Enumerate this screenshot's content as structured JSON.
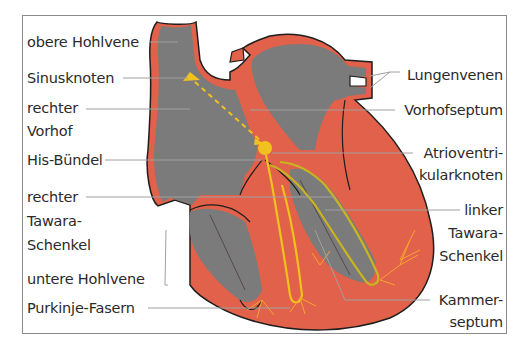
{
  "diagram": {
    "colors": {
      "chamber": "#7b7b7b",
      "muscle": "#e2614a",
      "outline": "#1e1e1e",
      "conduction": "#efc21e",
      "purkinje": "#f6a531",
      "leader": "#a0a0a0",
      "frame": "#8a8a8a"
    },
    "labels_left": [
      {
        "id": "obere-hohlvene",
        "lines": [
          "obere Hohlvene"
        ]
      },
      {
        "id": "sinusknoten",
        "lines": [
          "Sinusknoten"
        ]
      },
      {
        "id": "rechter-vorhof",
        "lines": [
          "rechter",
          "Vorhof"
        ]
      },
      {
        "id": "his-buendel",
        "lines": [
          "His-Bündel"
        ]
      },
      {
        "id": "rechter-tawara-schenkel",
        "lines": [
          "rechter",
          "Tawara-",
          "Schenkel"
        ]
      },
      {
        "id": "untere-hohlvene",
        "lines": [
          "untere Hohlvene"
        ]
      },
      {
        "id": "purkinje-fasern",
        "lines": [
          "Purkinje-Fasern"
        ]
      }
    ],
    "labels_right": [
      {
        "id": "lungenvenen",
        "lines": [
          "Lungenvenen"
        ]
      },
      {
        "id": "vorhofseptum",
        "lines": [
          "Vorhofseptum"
        ]
      },
      {
        "id": "atrioventrikularknoten",
        "lines": [
          "Atrioventri-",
          "kularknoten"
        ]
      },
      {
        "id": "linker-tawara-schenkel",
        "lines": [
          "linker",
          "Tawara-",
          "Schenkel"
        ]
      },
      {
        "id": "kammerseptum",
        "lines": [
          "Kammer-",
          "septum"
        ]
      }
    ]
  }
}
